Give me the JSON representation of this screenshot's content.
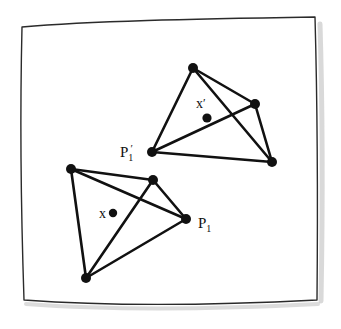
{
  "figure": {
    "title": "",
    "caption": "",
    "background_color": "#ffffff",
    "ink_color": "#111111",
    "frame": {
      "name": "hand-drawn-page-border",
      "stroke_color": "#2b2b2b",
      "stroke_width": 1.4,
      "shadow_color": "#b9b9b9",
      "path": "M 22,27 C 90,21 190,19 315,17 C 317,90 318,190 317,300 C 220,305 120,307 24,300 C 21,210 20,110 22,27 Z"
    },
    "shapes": {
      "source_polygon": {
        "name": "source-polygon",
        "label": "P1",
        "vertices": [
          {
            "name": "vertex-a",
            "x": 71,
            "y": 169
          },
          {
            "name": "vertex-b",
            "x": 153,
            "y": 180
          },
          {
            "name": "vertex-p1",
            "x": 186,
            "y": 219
          },
          {
            "name": "vertex-c",
            "x": 86,
            "y": 278
          }
        ],
        "edges": [
          [
            0,
            1
          ],
          [
            1,
            2
          ],
          [
            2,
            3
          ],
          [
            3,
            0
          ],
          [
            0,
            2
          ],
          [
            3,
            1
          ]
        ]
      },
      "target_polygon": {
        "name": "target-polygon",
        "label": "P1'",
        "vertices": [
          {
            "name": "vertex-a-prime",
            "x": 193,
            "y": 68
          },
          {
            "name": "vertex-b-prime",
            "x": 255,
            "y": 104
          },
          {
            "name": "vertex-c-prime",
            "x": 272,
            "y": 162
          },
          {
            "name": "vertex-p1-prime",
            "x": 152,
            "y": 152
          }
        ],
        "edges": [
          [
            0,
            1
          ],
          [
            1,
            2
          ],
          [
            2,
            3
          ],
          [
            3,
            0
          ],
          [
            0,
            2
          ],
          [
            3,
            1
          ]
        ]
      }
    },
    "points": {
      "x_point": {
        "name": "interior-point-x",
        "label": "x",
        "dot": {
          "x": 113,
          "y": 213
        },
        "label_pos": {
          "x": 99,
          "y": 218
        },
        "radius": 4.2
      },
      "x_prime_point": {
        "name": "interior-point-x-prime",
        "label": "x",
        "prime": "′",
        "dot": {
          "x": 207,
          "y": 118
        },
        "label_pos": {
          "x": 196,
          "y": 108
        },
        "radius": 4.6
      }
    },
    "labels": {
      "p1": {
        "name": "label-p1",
        "base": "P",
        "sub": "1",
        "prime": "",
        "pos": {
          "x": 198,
          "y": 228
        }
      },
      "p1_prime": {
        "name": "label-p1-prime",
        "base": "P",
        "sub": "1",
        "prime": "′",
        "pos": {
          "x": 120,
          "y": 157
        }
      }
    },
    "vertex_dot_radius": 5.0,
    "edge_stroke_width": 2.6
  }
}
